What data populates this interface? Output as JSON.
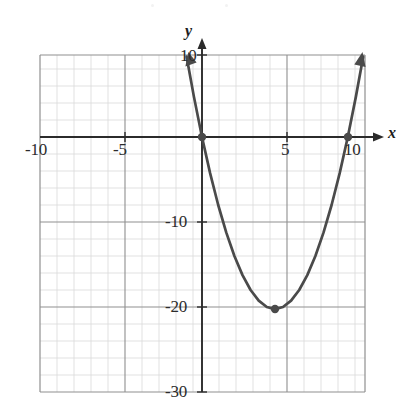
{
  "figure": {
    "kind": "coordinate-grid-graph",
    "background_color": "#ffffff",
    "curve_color": "#4a4a4a",
    "axis_color": "#2b2b2b",
    "major_grid_color": "#8c8c8c",
    "minor_grid_color": "#d9d9d9",
    "point_color": "#4a4a4a"
  },
  "axes": {
    "x_name": "x",
    "y_name": "y",
    "x_ticks": [
      {
        "label": "-10",
        "value": -10
      },
      {
        "label": "-5",
        "value": -5
      },
      {
        "label": "5",
        "value": 5
      },
      {
        "label": "10",
        "value": 10
      }
    ],
    "y_ticks": [
      {
        "label": "10",
        "value": 10
      },
      {
        "label": "-10",
        "value": -10
      },
      {
        "label": "-20",
        "value": -20
      },
      {
        "label": "-30",
        "value": -30
      }
    ]
  },
  "chart_data": {
    "type": "line",
    "title": "",
    "subtitle": "",
    "xlabel": "x",
    "ylabel": "y",
    "xlim": [
      -11,
      10.5
    ],
    "ylim": [
      -30,
      9.6
    ],
    "grid": true,
    "grid_major_step": 5,
    "grid_minor_step": 1,
    "legend": null,
    "series": [
      {
        "name": "y = x^2 - 9x",
        "type": "parabola",
        "equation": "y = x^2 - 9x",
        "color": "#4a4a4a",
        "opens": "up",
        "vertex": [
          4.5,
          -20.25
        ],
        "roots": [
          0,
          9
        ],
        "arrow_ends": [
          "upper-left",
          "upper-right"
        ],
        "x": [
          -0.95,
          -0.5,
          0,
          0.5,
          1,
          1.5,
          2,
          2.5,
          3,
          3.5,
          4,
          4.5,
          5,
          5.5,
          6,
          6.5,
          7,
          7.5,
          8,
          8.5,
          9,
          9.5,
          9.95
        ],
        "values": [
          9.45,
          4.75,
          0,
          -4.25,
          -8,
          -11.25,
          -14,
          -16.25,
          -18,
          -19.25,
          -20,
          -20.25,
          -20,
          -19.25,
          -18,
          -16.25,
          -14,
          -11.25,
          -8,
          -4.25,
          0,
          4.75,
          9.45
        ]
      }
    ],
    "annotations": [
      {
        "name": "x-intercept-left",
        "x": 0,
        "y": 0,
        "marker": "filled-dot"
      },
      {
        "name": "x-intercept-right",
        "x": 9,
        "y": 0,
        "marker": "filled-dot"
      },
      {
        "name": "vertex",
        "x": 4.5,
        "y": -20.25,
        "marker": "filled-dot"
      }
    ]
  }
}
